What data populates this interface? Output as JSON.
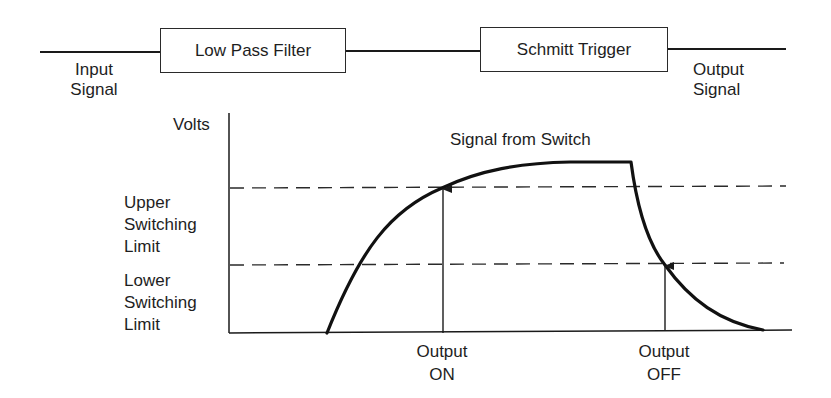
{
  "block_diagram": {
    "input_label": [
      "Input",
      "Signal"
    ],
    "output_label": [
      "Output",
      "Signal"
    ],
    "blocks": [
      {
        "label": "Low Pass Filter"
      },
      {
        "label": "Schmitt Trigger"
      }
    ]
  },
  "graph": {
    "y_axis_label": "Volts",
    "curve_label": "Signal from Switch",
    "thresholds": [
      {
        "name": "upper",
        "label": [
          "Upper",
          "Switching",
          "Limit"
        ]
      },
      {
        "name": "lower",
        "label": [
          "Lower",
          "Switching",
          "Limit"
        ]
      }
    ],
    "markers": [
      {
        "name": "on",
        "label": [
          "Output",
          "ON"
        ]
      },
      {
        "name": "off",
        "label": [
          "Output",
          "OFF"
        ]
      }
    ]
  },
  "colors": {
    "line": "#1a1a1a",
    "background": "#ffffff"
  }
}
